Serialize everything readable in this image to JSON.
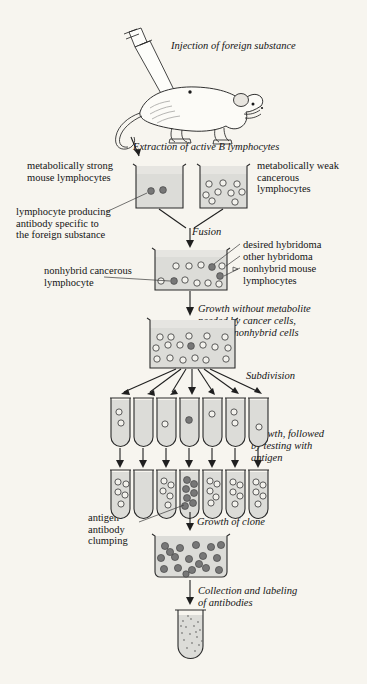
{
  "diagram": {
    "background_color": "#f7f5ef",
    "ink_color": "#141414"
  },
  "steps": [
    {
      "id": "injection",
      "label": "Injection of foreign substance",
      "style": "italic"
    },
    {
      "id": "extraction",
      "label": "Extraction of active B lymphocytes",
      "style": "italic"
    },
    {
      "id": "fusion",
      "label": "Fusion",
      "style": "italic"
    },
    {
      "id": "selection",
      "label": "Growth without metabolite\nneeded by cancer cells,\nuntil all nonhybrid cells\ndie out",
      "style": "italic"
    },
    {
      "id": "subdivision",
      "label": "Subdivision",
      "style": "italic"
    },
    {
      "id": "testing",
      "label": "Growth, followed\nby testing with\nantigen",
      "style": "italic"
    },
    {
      "id": "clone-growth",
      "label": "Growth of clone",
      "style": "italic"
    },
    {
      "id": "collection",
      "label": "Collection and labeling\nof antibodies",
      "style": "italic"
    }
  ],
  "annotations": [
    {
      "id": "strong-mouse-lymphocytes",
      "label": "metabolically strong\nmouse lymphocytes"
    },
    {
      "id": "weak-cancerous-lymphocytes",
      "label": "metabolically weak\ncancerous\nlymphocytes"
    },
    {
      "id": "antibody-producing-lymphocyte",
      "label": "lymphocyte producing\nantibody specific to\nthe foreign substance"
    },
    {
      "id": "desired-hybridoma",
      "label": "desired hybridoma"
    },
    {
      "id": "other-hybridoma",
      "label": "other hybridoma"
    },
    {
      "id": "nonhybrid-mouse-lymphocytes",
      "label": "nonhybrid mouse\nlymphocytes"
    },
    {
      "id": "nonhybrid-cancerous-lymphocyte",
      "label": "nonhybrid cancerous\nlymphocyte"
    },
    {
      "id": "antigen-antibody-clumping",
      "label": "antigen-\nantibody\nclumping"
    }
  ],
  "vessels": {
    "beaker_strong": {
      "id": "beaker-strong-lymphocytes",
      "dark_cells": 2,
      "open_cells": 0
    },
    "beaker_weak": {
      "id": "beaker-weak-cancerous",
      "dark_cells": 0,
      "open_cells": 9
    },
    "beaker_fusion": {
      "id": "beaker-fusion-mixture",
      "dark_cells": 3,
      "open_cells": 9
    },
    "beaker_selection": {
      "id": "beaker-selection-culture",
      "dark_cells": 1,
      "open_cells": 17
    },
    "beaker_clone": {
      "id": "beaker-clone-growth",
      "dark_cells": 18,
      "open_cells": 0
    },
    "final_tube": {
      "id": "tube-collected-antibodies",
      "content": "antibody solution"
    },
    "tube_row_1": {
      "id": "tube-row-subdivision",
      "count": 7,
      "tubes": [
        {
          "open_cells": 2,
          "dark_cells": 0
        },
        {
          "open_cells": 0,
          "dark_cells": 0
        },
        {
          "open_cells": 1,
          "dark_cells": 0
        },
        {
          "open_cells": 0,
          "dark_cells": 1
        },
        {
          "open_cells": 1,
          "dark_cells": 0
        },
        {
          "open_cells": 2,
          "dark_cells": 0
        },
        {
          "open_cells": 1,
          "dark_cells": 0
        }
      ]
    },
    "tube_row_2": {
      "id": "tube-row-tested",
      "count": 7,
      "tubes": [
        {
          "open_cells": 5,
          "dark_cells": 0
        },
        {
          "open_cells": 0,
          "dark_cells": 0
        },
        {
          "open_cells": 5,
          "dark_cells": 0
        },
        {
          "open_cells": 0,
          "dark_cells": 7
        },
        {
          "open_cells": 5,
          "dark_cells": 0
        },
        {
          "open_cells": 5,
          "dark_cells": 0
        },
        {
          "open_cells": 5,
          "dark_cells": 0
        }
      ]
    }
  },
  "figures": {
    "mouse": {
      "id": "laboratory-mouse"
    },
    "syringe": {
      "id": "syringe"
    }
  }
}
